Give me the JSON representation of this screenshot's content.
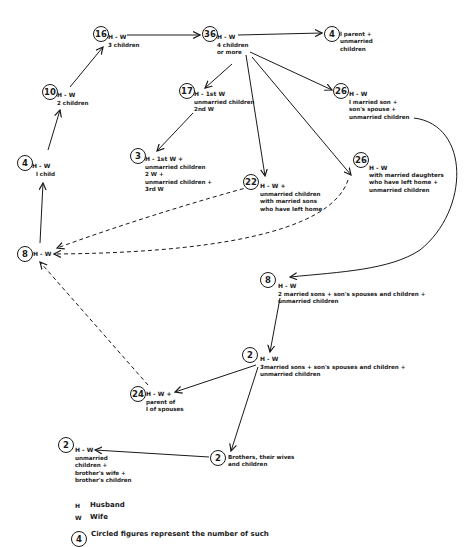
{
  "diagram": {
    "nodes": [
      {
        "id": "n16",
        "count": "16",
        "label": "H - W",
        "desc": "3 children"
      },
      {
        "id": "n36",
        "count": "36",
        "label": "H - W",
        "desc": "4 children\nor more"
      },
      {
        "id": "n4top",
        "count": "4",
        "label": "",
        "desc": "l parent +\nunmarried\nchildren"
      },
      {
        "id": "n10",
        "count": "10",
        "label": "H - W",
        "desc": "2 children"
      },
      {
        "id": "n17",
        "count": "17",
        "label": "H - 1st W",
        "desc": "unmarried children\n2nd W"
      },
      {
        "id": "n26a",
        "count": "26",
        "label": "H - W",
        "desc": "l married son +\nson's spouse +\nunmarried children"
      },
      {
        "id": "n4",
        "count": "4",
        "label": "H - W",
        "desc": "l child"
      },
      {
        "id": "n3",
        "count": "3",
        "label": "H - 1st W +",
        "desc": "unmarried children\n2 W +\nunmarried children +\n3rd W"
      },
      {
        "id": "n22",
        "count": "22",
        "label": "H - W +",
        "desc": "unmarried children\nwith married sons\nwho have left home"
      },
      {
        "id": "n26b",
        "count": "26",
        "label": "H - W",
        "desc": "with married daughters\nwho have left home +\nunmarried children"
      },
      {
        "id": "n8left",
        "count": "8",
        "label": "H - W",
        "desc": ""
      },
      {
        "id": "n8",
        "count": "8",
        "label": "H - W",
        "desc": "2 married sons + son's spouses and children +\nunmarried children"
      },
      {
        "id": "n2mid",
        "count": "2",
        "label": "H - W",
        "desc": "3married sons + son's spouses and children +\nunmarried children"
      },
      {
        "id": "n24",
        "count": "24",
        "label": "H - W +",
        "desc": "parent of\nl of spouses"
      },
      {
        "id": "n2left",
        "count": "2",
        "label": "H - W",
        "desc": "unmarried\nchildren +\nbrother's wife +\nbrother's children"
      },
      {
        "id": "n2bro",
        "count": "2",
        "label": "",
        "desc": "Brothers, their wives\nand children"
      }
    ]
  },
  "legend": {
    "items": [
      {
        "key": "H",
        "value": "Husband"
      },
      {
        "key": "W",
        "value": "Wife"
      }
    ],
    "circle_example": "4",
    "circle_note": "Circled figures represent the number of such"
  },
  "colors": {
    "ink": "#1a1a1a",
    "background": "#ffffff"
  }
}
